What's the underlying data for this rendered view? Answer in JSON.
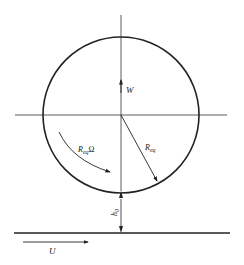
{
  "diagram": {
    "labels": {
      "load": "W",
      "radius_main": "R",
      "radius_sub": "eq",
      "rot_main": "R",
      "rot_sub": "eq",
      "rot_omega": "Ω",
      "gap_main": "h",
      "gap_sub": "0",
      "velocity": "U"
    },
    "colors": {
      "stroke": "#222222",
      "background": "#ffffff"
    }
  }
}
